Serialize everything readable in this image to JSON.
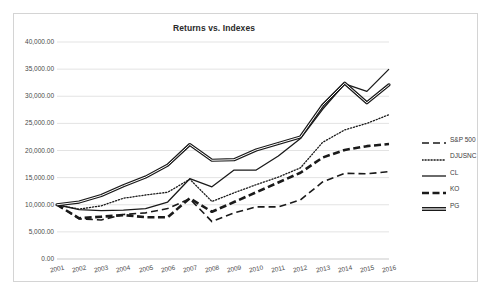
{
  "chart_data": {
    "type": "line",
    "title": "Returns vs. Indexes",
    "xlabel": "",
    "ylabel": "",
    "grid": true,
    "legend_position": "right",
    "ylim": [
      0,
      40000
    ],
    "ytick_step": 5000,
    "ytick_labels": [
      "40,000.00",
      "35,000.00",
      "30,000.00",
      "25,000.00",
      "20,000.00",
      "15,000.00",
      "10,000.00",
      "5,000.00",
      "0.00"
    ],
    "ytick_values": [
      40000,
      35000,
      30000,
      25000,
      20000,
      15000,
      10000,
      5000,
      0
    ],
    "categories": [
      "2001",
      "2002",
      "2003",
      "2004",
      "2005",
      "2006",
      "2007",
      "2008",
      "2009",
      "2010",
      "2011",
      "2012",
      "2013",
      "2014",
      "2015",
      "2016"
    ],
    "x": [
      2001,
      2002,
      2003,
      2004,
      2005,
      2006,
      2007,
      2008,
      2009,
      2010,
      2011,
      2012,
      2013,
      2014,
      2015,
      2016
    ],
    "series": [
      {
        "name": "S&P 500",
        "style": "dashed",
        "color": "#1a1a1a",
        "width": 1.6,
        "values": [
          10000,
          7400,
          7200,
          8200,
          8500,
          9300,
          11100,
          6900,
          8500,
          9600,
          9600,
          10900,
          14200,
          15800,
          15700,
          16100
        ]
      },
      {
        "name": "DJUSNC",
        "style": "dotted",
        "color": "#1a1a1a",
        "width": 1.3,
        "values": [
          10000,
          9200,
          9800,
          11200,
          11800,
          12300,
          14700,
          10600,
          12200,
          13700,
          15100,
          16800,
          21500,
          23800,
          25000,
          26600
        ]
      },
      {
        "name": "CL",
        "style": "solid",
        "color": "#1a1a1a",
        "width": 1.3,
        "values": [
          10000,
          9100,
          8900,
          9000,
          9300,
          10500,
          14800,
          13300,
          16400,
          16400,
          19000,
          22200,
          27600,
          32300,
          30900,
          35000
        ]
      },
      {
        "name": "KO",
        "style": "thick-dashed",
        "color": "#1a1a1a",
        "width": 2.6,
        "values": [
          10000,
          7500,
          7800,
          8100,
          7700,
          7700,
          11200,
          8700,
          10500,
          12300,
          14100,
          15900,
          18700,
          20100,
          20800,
          21200
        ]
      },
      {
        "name": "PG",
        "style": "double-solid",
        "color": "#1a1a1a",
        "width": 2.6,
        "values": [
          10000,
          10500,
          11700,
          13500,
          15100,
          17300,
          21100,
          18200,
          18300,
          20100,
          21300,
          22500,
          28300,
          32400,
          28800,
          32100
        ]
      }
    ]
  },
  "legend": {
    "items": [
      {
        "label": "S&P 500",
        "style": "dashed"
      },
      {
        "label": "DJUSNC",
        "style": "dotted"
      },
      {
        "label": "CL",
        "style": "solid"
      },
      {
        "label": "KO",
        "style": "thick-dashed"
      },
      {
        "label": "PG",
        "style": "double-solid"
      }
    ]
  },
  "colors": {
    "frame_border": "#d4d4d4",
    "gridline": "#e3e3e3",
    "axis_line": "#c9c9c9",
    "text": "#4a4a4a",
    "title": "#2a2a2a",
    "plot_line": "#1a1a1a",
    "background": "#ffffff"
  }
}
